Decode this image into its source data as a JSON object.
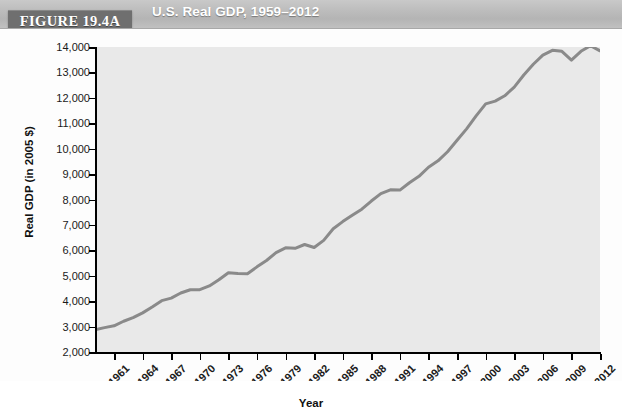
{
  "header": {
    "figure_tag": "FIGURE 19.4A",
    "title": "U.S. Real GDP, 1959–2012"
  },
  "colors": {
    "header_band": "#bdbdbd",
    "figure_tag_bg": "#6f6f6f",
    "plot_bg": "#e9e9e9",
    "line": "#8a8a8a",
    "axis": "#000000",
    "text": "#1a1a1a"
  },
  "chart_data": {
    "type": "line",
    "title": "U.S. Real GDP, 1959–2012",
    "xlabel": "Year",
    "ylabel": "Real GDP (in 2005 $)",
    "ylim": [
      2000,
      14000
    ],
    "xlim": [
      1959,
      2012
    ],
    "ytick_labels": [
      "2,000",
      "3,000",
      "4,000",
      "5,000",
      "6,000",
      "7,000",
      "8,000",
      "9,000",
      "10,000",
      "11,000",
      "12,000",
      "13,000",
      "14,000"
    ],
    "ytick_values": [
      2000,
      3000,
      4000,
      5000,
      6000,
      7000,
      8000,
      9000,
      10000,
      11000,
      12000,
      13000,
      14000
    ],
    "xtick_labels": [
      "1961",
      "1964",
      "1967",
      "1970",
      "1973",
      "1976",
      "1979",
      "1982",
      "1985",
      "1988",
      "1991",
      "1994",
      "1997",
      "2000",
      "2003",
      "2006",
      "2009",
      "2012"
    ],
    "xtick_values": [
      1961,
      1964,
      1967,
      1970,
      1973,
      1976,
      1979,
      1982,
      1985,
      1988,
      1991,
      1994,
      1997,
      2000,
      2003,
      2006,
      2009,
      2012
    ],
    "grid": false,
    "legend": null,
    "series": [
      {
        "name": "Real GDP (in 2005 $)",
        "color": "#8a8a8a",
        "x": [
          1959,
          1960,
          1961,
          1962,
          1963,
          1964,
          1965,
          1966,
          1967,
          1968,
          1969,
          1970,
          1971,
          1972,
          1973,
          1974,
          1975,
          1976,
          1977,
          1978,
          1979,
          1980,
          1981,
          1982,
          1983,
          1984,
          1985,
          1986,
          1987,
          1988,
          1989,
          1990,
          1991,
          1992,
          1993,
          1994,
          1995,
          1996,
          1997,
          1998,
          1999,
          2000,
          2001,
          2002,
          2003,
          2004,
          2005,
          2006,
          2007,
          2008,
          2009,
          2010,
          2011,
          2012
        ],
        "y": [
          2870,
          2960,
          3030,
          3210,
          3350,
          3540,
          3770,
          4020,
          4120,
          4320,
          4450,
          4450,
          4600,
          4840,
          5120,
          5090,
          5080,
          5350,
          5600,
          5910,
          6100,
          6080,
          6230,
          6110,
          6390,
          6850,
          7130,
          7380,
          7620,
          7940,
          8230,
          8380,
          8370,
          8660,
          8910,
          9270,
          9520,
          9880,
          10330,
          10780,
          11290,
          11760,
          11870,
          12080,
          12420,
          12900,
          13320,
          13680,
          13870,
          13830,
          13480,
          13830,
          14050,
          13850
        ],
        "y_note": "Values in billions of 2005 dollars, read from axis"
      }
    ],
    "annotations": []
  },
  "axis_titles": {
    "x": "Year",
    "y": "Real GDP (in 2005 $)"
  }
}
